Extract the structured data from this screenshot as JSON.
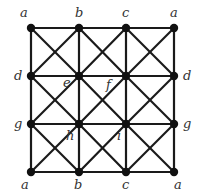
{
  "diagram": {
    "type": "grid-graph-torus-identification",
    "grid": {
      "cols": 4,
      "rows": 4,
      "x": [
        31,
        79,
        126,
        174
      ],
      "y": [
        28,
        76,
        124,
        172
      ],
      "cell_diagonals": true
    },
    "node_labels": [
      {
        "id": "r0c0",
        "label": "a",
        "x": 20,
        "y": 17
      },
      {
        "id": "r0c1",
        "label": "b",
        "x": 75,
        "y": 17
      },
      {
        "id": "r0c2",
        "label": "c",
        "x": 122,
        "y": 17
      },
      {
        "id": "r0c3",
        "label": "a",
        "x": 170,
        "y": 17
      },
      {
        "id": "r1c0",
        "label": "d",
        "x": 14,
        "y": 80
      },
      {
        "id": "r1c1",
        "label": "e",
        "x": 63,
        "y": 87
      },
      {
        "id": "r1c2",
        "label": "f",
        "x": 106,
        "y": 89
      },
      {
        "id": "r1c3",
        "label": "d",
        "x": 183,
        "y": 80
      },
      {
        "id": "r2c0",
        "label": "g",
        "x": 14,
        "y": 128
      },
      {
        "id": "r2c1",
        "label": "h",
        "x": 66,
        "y": 140
      },
      {
        "id": "r2c2",
        "label": "i",
        "x": 117,
        "y": 140
      },
      {
        "id": "r2c3",
        "label": "g",
        "x": 183,
        "y": 128
      },
      {
        "id": "r3c0",
        "label": "a",
        "x": 21,
        "y": 189
      },
      {
        "id": "r3c1",
        "label": "b",
        "x": 74,
        "y": 189
      },
      {
        "id": "r3c2",
        "label": "c",
        "x": 122,
        "y": 189
      },
      {
        "id": "r3c3",
        "label": "a",
        "x": 174,
        "y": 189
      }
    ],
    "colors": {
      "edge": "#1a1a1a",
      "node": "#111111",
      "label": "#333333"
    }
  }
}
